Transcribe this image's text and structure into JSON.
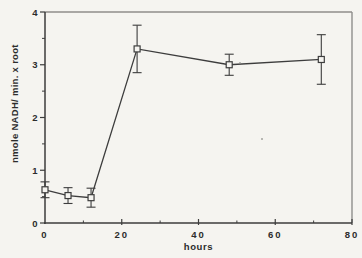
{
  "figure": {
    "background": "#f5f4f0",
    "axis_color": "#3d3d3d",
    "frame_color": "#8f8e8b",
    "text_color": "#2c2c2c"
  },
  "chart_data": {
    "type": "line",
    "title": "",
    "xlabel": "hours",
    "ylabel": "nmole NADH/ min. x root",
    "xlim": [
      0,
      80
    ],
    "ylim": [
      0,
      4
    ],
    "x_major_ticks": [
      0,
      20,
      40,
      60,
      80
    ],
    "x_minor_step": 10,
    "y_major_ticks": [
      0,
      1,
      2,
      3,
      4
    ],
    "y_minor_step": 0.5,
    "grid": false,
    "legend_position": "none",
    "marker": "open-square",
    "error_bars": true,
    "series": [
      {
        "x": [
          0,
          6,
          12,
          24,
          48,
          72
        ],
        "y": [
          0.63,
          0.52,
          0.48,
          3.3,
          3.0,
          3.1
        ],
        "y_err": [
          0.15,
          0.15,
          0.18,
          0.45,
          0.2,
          0.47
        ]
      }
    ]
  }
}
